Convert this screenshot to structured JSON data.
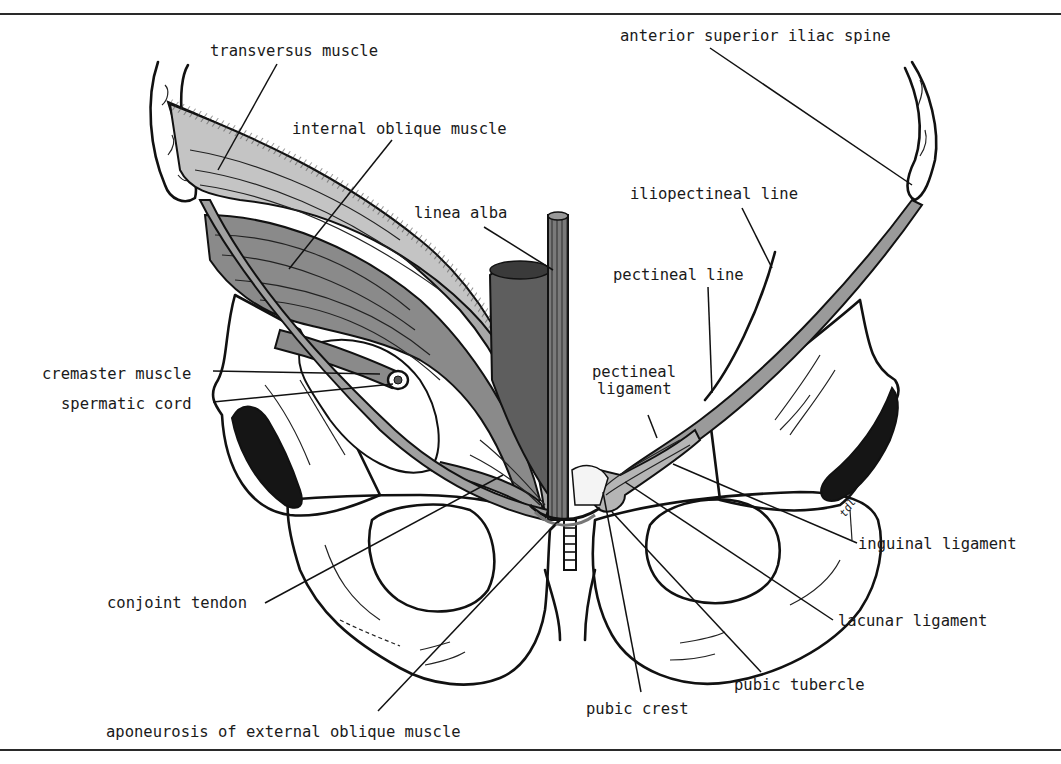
{
  "figure": {
    "colors": {
      "background": "#ffffff",
      "ink": "#111111",
      "muscle_light": "#b9b9b9",
      "muscle_mid": "#8f8f8f",
      "muscle_dark": "#6a6a6a",
      "foramen_dark": "#151515"
    },
    "artist_initials": "tdl"
  },
  "labels": {
    "transversus_muscle": "transversus muscle",
    "internal_oblique_muscle": "internal oblique muscle",
    "linea_alba": "linea alba",
    "anterior_superior_iliac_spine": "anterior superior iliac spine",
    "iliopectineal_line": "iliopectineal line",
    "pectineal_line": "pectineal line",
    "pectineal_ligament_line1": "pectineal",
    "pectineal_ligament_line2": "ligament",
    "cremaster_muscle": "cremaster muscle",
    "spermatic_cord": "spermatic cord",
    "inguinal_ligament": "inguinal ligament",
    "lacunar_ligament": "lacunar ligament",
    "conjoint_tendon": "conjoint tendon",
    "pubic_tubercle": "pubic tubercle",
    "pubic_crest": "pubic crest",
    "aponeurosis_of_external_oblique_muscle": "aponeurosis of external oblique muscle"
  }
}
